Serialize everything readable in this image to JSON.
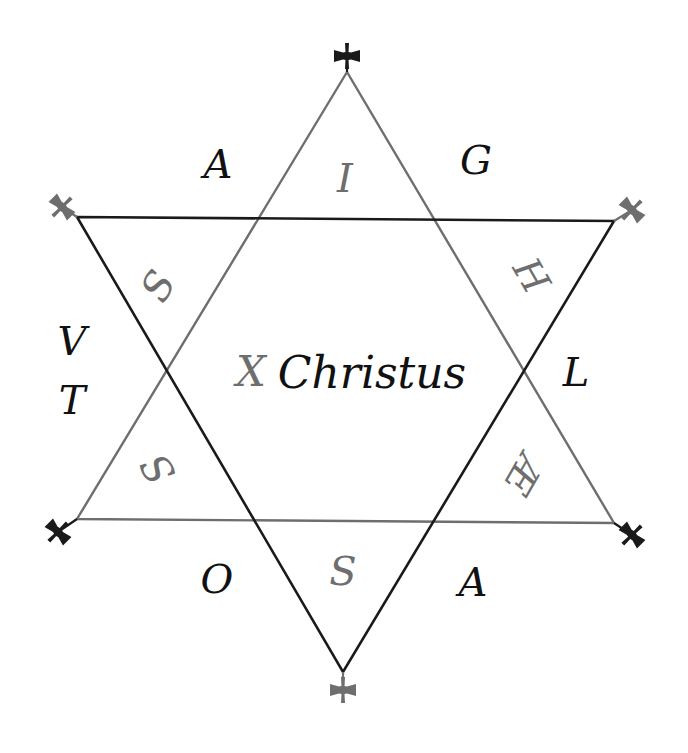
{
  "diagram": {
    "title": "Christus",
    "colors": {
      "background": "#ffffff",
      "up_triangle": "#6e6e6e",
      "down_triangle": "#1a1a1a",
      "gray_letters": "#6e6e6e",
      "black_letters": "#111111"
    },
    "up_triangle": {
      "points": [
        [
          347,
          72
        ],
        [
          77,
          519
        ],
        [
          614,
          523
        ]
      ],
      "color": "gray"
    },
    "down_triangle": {
      "points": [
        [
          77,
          217
        ],
        [
          614,
          221
        ],
        [
          343,
          672
        ]
      ],
      "color": "black"
    },
    "crosses": [
      {
        "name": "top",
        "x": 347,
        "y": 56,
        "rotate": 0,
        "color": "black"
      },
      {
        "name": "top-left",
        "x": 62,
        "y": 207,
        "rotate": 45,
        "color": "gray"
      },
      {
        "name": "top-right",
        "x": 632,
        "y": 210,
        "rotate": 45,
        "color": "gray"
      },
      {
        "name": "bottom-left",
        "x": 58,
        "y": 532,
        "rotate": 45,
        "color": "black"
      },
      {
        "name": "bottom-right",
        "x": 632,
        "y": 535,
        "rotate": 45,
        "color": "black"
      },
      {
        "name": "bottom",
        "x": 343,
        "y": 690,
        "rotate": 0,
        "color": "gray"
      }
    ],
    "letters": {
      "outer_top_left": "A",
      "inner_top": "I",
      "outer_top_right": "G",
      "inner_upper_left": "S",
      "inner_upper_right": "H",
      "outer_left_upper": "V",
      "outer_left_lower": "T",
      "center_x": "X",
      "center_word": "Christus",
      "outer_right": "L",
      "inner_lower_left": "S",
      "inner_lower_right": "Æ",
      "outer_bottom_left": "O",
      "inner_bottom": "S",
      "outer_bottom_right": "A"
    }
  }
}
